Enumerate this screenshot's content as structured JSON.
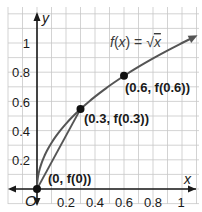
{
  "chart_data": {
    "type": "line",
    "title": "",
    "xlabel": "x",
    "ylabel": "y",
    "xlim": [
      -0.1,
      1.1
    ],
    "ylim": [
      -0.1,
      1.2
    ],
    "grid": true,
    "grid_step": 0.1,
    "x_ticks": [
      0.2,
      0.4,
      0.6,
      0.8,
      1
    ],
    "x_tick_labels": [
      "0.2",
      "0.4",
      "0.6",
      "0.8",
      "1"
    ],
    "y_ticks": [
      0.2,
      0.4,
      0.6,
      0.8,
      1
    ],
    "y_tick_labels": [
      "0.2",
      "0.4",
      "0.6",
      "0.8",
      "1"
    ],
    "origin_label": "O",
    "series": [
      {
        "name": "f(x) = √x",
        "kind": "curve",
        "x": [
          0,
          0.01,
          0.05,
          0.1,
          0.2,
          0.3,
          0.4,
          0.5,
          0.6,
          0.7,
          0.8,
          0.9,
          1.0,
          1.1
        ],
        "values": [
          0,
          0.1,
          0.224,
          0.316,
          0.447,
          0.548,
          0.632,
          0.707,
          0.775,
          0.837,
          0.894,
          0.949,
          1.0,
          1.049
        ]
      },
      {
        "name": "secant (0, f(0)) to (0.3, f(0.3))",
        "kind": "segment",
        "x": [
          0,
          0.3
        ],
        "values": [
          0,
          0.548
        ]
      }
    ],
    "points": [
      {
        "label": "(0, f(0))",
        "x": 0,
        "y": 0
      },
      {
        "label": "(0.3, f(0.3))",
        "x": 0.3,
        "y": 0.548
      },
      {
        "label": "(0.6, f(0.6))",
        "x": 0.6,
        "y": 0.775
      }
    ],
    "annotations": [
      {
        "text": "f(x) = √x",
        "near": [
          0.75,
          1.02
        ]
      }
    ]
  },
  "labels": {
    "y_axis": "y",
    "x_axis": "x",
    "origin": "O",
    "function": "f(x) = √x",
    "p0": "(0, f(0))",
    "p1": "(0.3, f(0.3))",
    "p2": "(0.6, f(0.6))",
    "ticks_x": [
      "0.2",
      "0.4",
      "0.6",
      "0.8",
      "1"
    ],
    "ticks_y": [
      "0.2",
      "0.4",
      "0.6",
      "0.8",
      "1"
    ]
  },
  "colors": {
    "grid": "#c8c8c8",
    "axis": "#1a1a1a",
    "curve": "#555555",
    "point": "#111111"
  }
}
